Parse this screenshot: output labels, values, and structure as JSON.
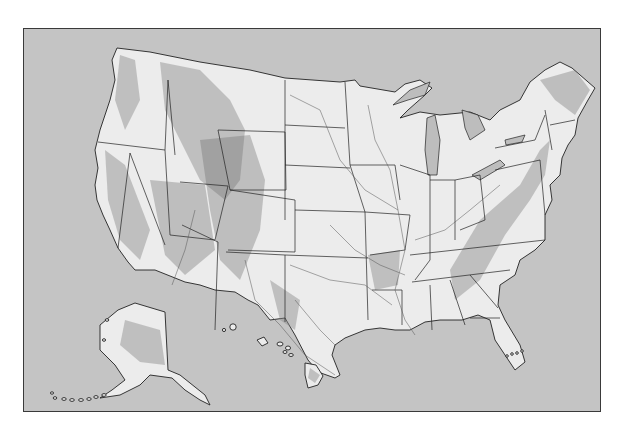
{
  "map": {
    "title": "",
    "type": "Shaded relief outline map of the United States",
    "regions": [
      "Contiguous United States",
      "Alaska",
      "Hawaii"
    ],
    "features": [
      "state boundaries",
      "major rivers",
      "Great Lakes",
      "mountain relief shading"
    ],
    "colors": {
      "ocean": "#c4c4c4",
      "land": "#ececec",
      "border": "#222222",
      "frame": "#3a3a3a",
      "relief": "#8a8a8a"
    },
    "labels": []
  }
}
